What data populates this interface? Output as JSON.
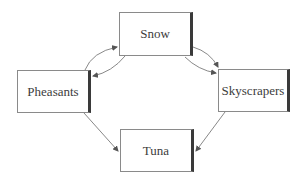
{
  "diagram": {
    "nodes": [
      {
        "id": "snow",
        "label": "Snow",
        "x": 119,
        "y": 12,
        "w": 74,
        "h": 44
      },
      {
        "id": "pheasants",
        "label": "Pheasants",
        "x": 17,
        "y": 70,
        "w": 74,
        "h": 43
      },
      {
        "id": "skyscrapers",
        "label": "Skyscrapers",
        "x": 218,
        "y": 69,
        "w": 72,
        "h": 43
      },
      {
        "id": "tuna",
        "label": "Tuna",
        "x": 120,
        "y": 129,
        "w": 74,
        "h": 43
      }
    ],
    "edges": [
      {
        "from": "pheasants",
        "to": "snow",
        "curve": "upper"
      },
      {
        "from": "snow",
        "to": "pheasants",
        "curve": "lower"
      },
      {
        "from": "snow",
        "to": "skyscrapers",
        "curve": "upper"
      },
      {
        "from": "snow",
        "to": "skyscrapers",
        "curve": "lower"
      },
      {
        "from": "pheasants",
        "to": "tuna",
        "curve": "straight"
      },
      {
        "from": "skyscrapers",
        "to": "tuna",
        "curve": "straight"
      }
    ],
    "colors": {
      "line": "#6a6a6a",
      "border": "#8a8a8a",
      "shadow": "#3a3a3a",
      "text": "#3c3c3c"
    }
  }
}
